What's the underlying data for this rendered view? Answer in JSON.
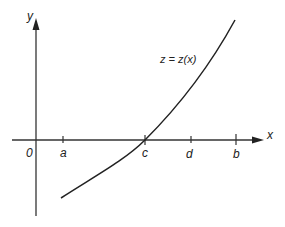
{
  "diagram": {
    "axes": {
      "x_label": "x",
      "y_label": "y",
      "origin_label": "0"
    },
    "ticks": [
      {
        "name": "a",
        "label": "a",
        "px": 63
      },
      {
        "name": "c",
        "label": "c",
        "px": 145
      },
      {
        "name": "d",
        "label": "d",
        "px": 191
      },
      {
        "name": "b",
        "label": "b",
        "px": 236
      }
    ],
    "curve": {
      "label": "z = z(x)",
      "description": "Increasing convex curve crossing the x-axis at c, starting below the axis near a and rising steeply past b"
    },
    "colors": {
      "stroke": "#222222",
      "background": "#ffffff"
    }
  }
}
